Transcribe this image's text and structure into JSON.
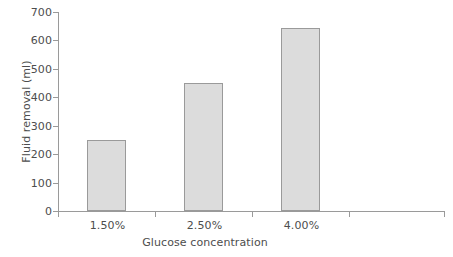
{
  "chart_data": {
    "type": "bar",
    "title": "",
    "xlabel": "Glucose concentration",
    "ylabel": "Fluid removal (ml)",
    "categories": [
      "1.50%",
      "2.50%",
      "4.00%"
    ],
    "values": [
      250,
      450,
      645
    ],
    "series": [
      {
        "name": "Fluid removal",
        "values": [
          250,
          450,
          645
        ]
      }
    ],
    "ylim": [
      0,
      700
    ],
    "yticks": [
      0,
      100,
      200,
      300,
      400,
      500,
      600,
      700
    ],
    "ytick_labels": [
      "0",
      "100",
      "200",
      "300",
      "400",
      "500",
      "600",
      "700"
    ],
    "xtick_labels": [
      "1.50%",
      "2.50%",
      "4.00%"
    ],
    "grid": false,
    "legend": false,
    "legend_position": "none",
    "bar_fill_color": "#dcdcdc",
    "bar_edge_color": "#9a9a9a",
    "axis_color": "#9a9a9a",
    "text_color": "#4d4d4d",
    "background_color": "#ffffff",
    "n_category_slots": 4,
    "annotations": []
  },
  "axes": {
    "y_title": "Fluid removal (ml)",
    "x_title": "Glucose concentration",
    "y_ticks": [
      {
        "label": "700",
        "value": 700
      },
      {
        "label": "600",
        "value": 600
      },
      {
        "label": "500",
        "value": 500
      },
      {
        "label": "400",
        "value": 400
      },
      {
        "label": "300",
        "value": 300
      },
      {
        "label": "200",
        "value": 200
      },
      {
        "label": "100",
        "value": 100
      },
      {
        "label": "0",
        "value": 0
      }
    ],
    "x_ticks": [
      {
        "label": "1.50%"
      },
      {
        "label": "2.50%"
      },
      {
        "label": "4.00%"
      }
    ]
  }
}
